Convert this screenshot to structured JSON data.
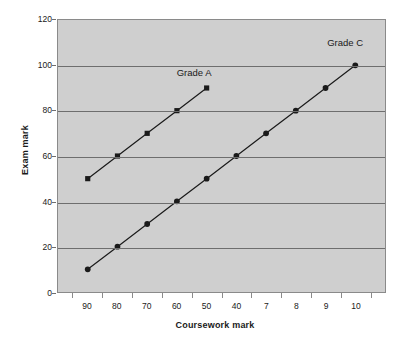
{
  "chart_data": {
    "type": "line",
    "title": "",
    "subtitle": "",
    "xlabel": "Coursework mark",
    "ylabel": "Exam mark",
    "x_tick_labels": [
      "90",
      "80",
      "70",
      "60",
      "50",
      "40",
      "7",
      "8",
      "9",
      "10"
    ],
    "x_positions": [
      1,
      2,
      3,
      4,
      5,
      6,
      7,
      8,
      9,
      10
    ],
    "y_tick_labels": [
      "0",
      "20",
      "40",
      "60",
      "80",
      "100",
      "120"
    ],
    "y_ticks": [
      0,
      20,
      40,
      60,
      80,
      100,
      120
    ],
    "ylim": [
      0,
      120
    ],
    "grid": "horizontal",
    "legend_position": "inline-annotation",
    "series": [
      {
        "name": "Grade A",
        "marker": "square",
        "color": "#1a1a1a",
        "x": [
          1,
          2,
          3,
          4,
          5
        ],
        "values": [
          50,
          60,
          70,
          80,
          90
        ],
        "annotation": "Grade A"
      },
      {
        "name": "Grade C",
        "marker": "circle",
        "color": "#1a1a1a",
        "x": [
          1,
          2,
          3,
          4,
          5,
          6,
          7,
          8,
          9,
          10
        ],
        "values": [
          10,
          20,
          30,
          40,
          50,
          60,
          70,
          80,
          90,
          100
        ],
        "annotation": "Grade C"
      }
    ],
    "annotations": [
      {
        "text": "Grade A",
        "x": 4.55,
        "y": 97
      },
      {
        "text": "Grade C",
        "x": 9.6,
        "y": 110
      }
    ],
    "colors": {
      "plot_background": "#cfcfcf",
      "figure_background": "#ffffff",
      "gridline": "#6e6e6e",
      "axis": "#8a8a8a",
      "series": "#1a1a1a",
      "text": "#1a1a1a"
    }
  }
}
